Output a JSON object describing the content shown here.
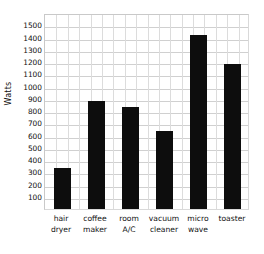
{
  "chart_data": {
    "type": "bar",
    "title": "",
    "xlabel": "",
    "ylabel": "Watts",
    "categories": [
      "hair dryer",
      "coffee maker",
      "room A/C",
      "vacuum cleaner",
      "micro wave",
      "toaster"
    ],
    "category_lines": [
      [
        "hair",
        "dryer"
      ],
      [
        "coffee",
        "maker"
      ],
      [
        "room",
        "A/C"
      ],
      [
        "vacuum",
        "cleaner"
      ],
      [
        "micro",
        "wave"
      ],
      [
        "toaster",
        ""
      ]
    ],
    "values": [
      350,
      900,
      850,
      650,
      1440,
      1200
    ],
    "ylim": [
      0,
      1600
    ],
    "yticks": [
      100,
      200,
      300,
      400,
      500,
      600,
      700,
      800,
      900,
      1000,
      1100,
      1200,
      1300,
      1400,
      1500
    ],
    "ytick_labels": [
      "100",
      "200",
      "300",
      "400",
      "500",
      "600",
      "700",
      "800",
      "900",
      "1000",
      "1100",
      "1200",
      "1300",
      "1400",
      "1500"
    ],
    "grid": true,
    "grid_axes": "both",
    "legend": false,
    "bar_color": "#0d0d0d",
    "grid_color": "#d0d0d0",
    "background": "#ffffff"
  }
}
